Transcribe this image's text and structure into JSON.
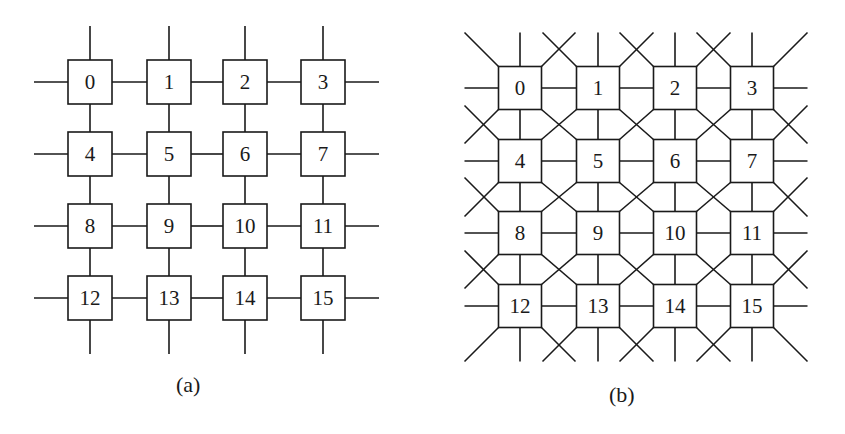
{
  "figure": {
    "panels": [
      {
        "id": "a",
        "caption": "(a)",
        "topology": "2D mesh (4-neighbor)",
        "rows": 4,
        "cols": 4,
        "nodes": [
          "0",
          "1",
          "2",
          "3",
          "4",
          "5",
          "6",
          "7",
          "8",
          "9",
          "10",
          "11",
          "12",
          "13",
          "14",
          "15"
        ],
        "x": [
          90,
          169,
          245,
          323
        ],
        "y": [
          82,
          154,
          226,
          298
        ],
        "box": 44,
        "stub": 34
      },
      {
        "id": "b",
        "caption": "(b)",
        "topology": "2D mesh with diagonal links (8-neighbor)",
        "rows": 4,
        "cols": 4,
        "nodes": [
          "0",
          "1",
          "2",
          "3",
          "4",
          "5",
          "6",
          "7",
          "8",
          "9",
          "10",
          "11",
          "12",
          "13",
          "14",
          "15"
        ],
        "x": [
          520,
          598,
          675,
          752
        ],
        "y": [
          88,
          161,
          233,
          306
        ],
        "box": 43,
        "stub": 34
      }
    ],
    "colors": {
      "line": "#1a1a1a",
      "box_fill": "#ffffff",
      "text": "#1a1a1a"
    }
  }
}
